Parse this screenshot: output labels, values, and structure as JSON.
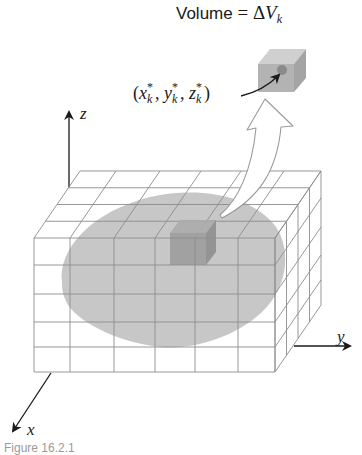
{
  "figure": {
    "volume_label": {
      "text": "Volume",
      "equals": "=",
      "symbol": "Δ",
      "variable": "V",
      "subscript": "k"
    },
    "point_label": {
      "open_paren": "(",
      "coords": [
        {
          "var": "x",
          "sup": "*",
          "sub": "k"
        },
        {
          "var": "y",
          "sup": "*",
          "sub": "k"
        },
        {
          "var": "z",
          "sup": "*",
          "sub": "k"
        }
      ],
      "separator": ", ",
      "close_paren": ")"
    },
    "axes": {
      "x": "x",
      "y": "y",
      "z": "z"
    },
    "caption": "Figure 16.2.1"
  },
  "colors": {
    "grid_line": "#8c8c8c",
    "axis": "#1a1a1a",
    "solid_region": "#c4c4c4",
    "highlight_box_front": "#9a9a9a",
    "highlight_box_top": "#ababab",
    "highlight_box_side": "#8e8e8e",
    "small_cube_front": "#b3b3b3",
    "small_cube_top": "#d0d0d0",
    "small_cube_side": "#a4a4a4",
    "point_dot": "#8a8a8a",
    "arrow_fill": "#ffffff",
    "arrow_stroke": "#9a9a9a"
  },
  "grid": {
    "front_columns": 6,
    "front_rows": 5,
    "depth_cells": 4
  }
}
